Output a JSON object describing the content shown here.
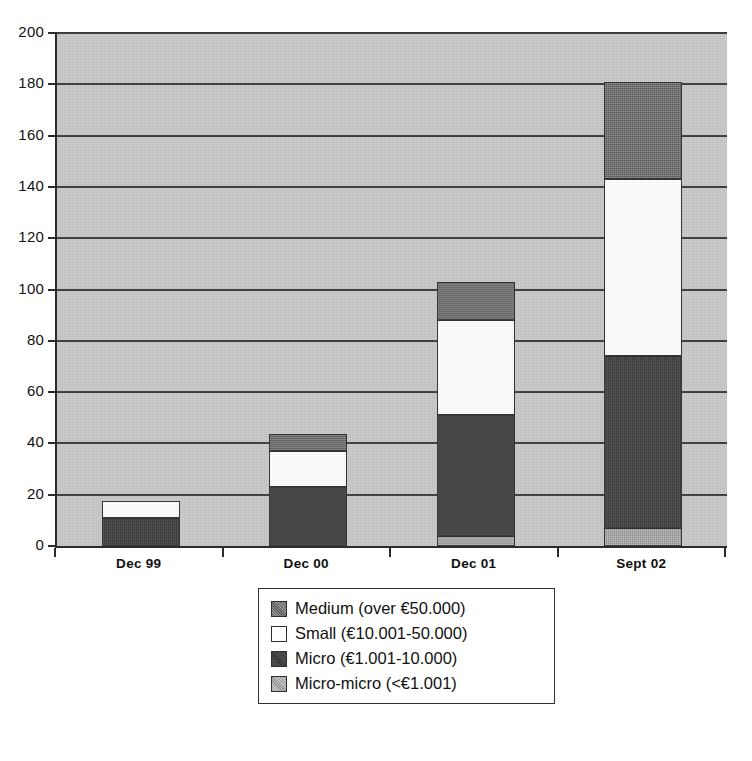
{
  "chart_data": {
    "type": "bar",
    "subtype": "stacked-vertical",
    "title": "",
    "xlabel": "",
    "ylabel": "",
    "categories": [
      "Dec 99",
      "Dec 00",
      "Dec 01",
      "Sept 02"
    ],
    "ylim": [
      0,
      200
    ],
    "yticks": [
      0,
      20,
      40,
      60,
      80,
      100,
      120,
      140,
      160,
      180,
      200
    ],
    "ytick_labels": [
      "0",
      "20",
      "40",
      "60",
      "80",
      "100",
      "120",
      "140",
      "160",
      "180",
      "200"
    ],
    "grid": true,
    "grid_axis": "y",
    "legend_position": "bottom-center",
    "stack_order_bottom_to_top": [
      "Micro-micro (<€1.001)",
      "Micro (€1.001-10.000)",
      "Small (€10.001-50.000)",
      "Medium (over €50.000)"
    ],
    "series": [
      {
        "name": "Medium (over €50.000)",
        "key": "medium",
        "color": "#6e6e6e",
        "values": [
          0,
          6.5,
          15,
          38
        ]
      },
      {
        "name": "Small (€10.001-50.000)",
        "key": "small",
        "color": "#ffffff",
        "values": [
          6.5,
          14,
          37,
          69
        ]
      },
      {
        "name": "Micro (€1.001-10.000)",
        "key": "micro",
        "color": "#3b3b3b",
        "values": [
          11,
          23,
          47,
          67
        ]
      },
      {
        "name": "Micro-micro (<€1.001)",
        "key": "micromicro",
        "color": "#a8a8a8",
        "values": [
          0,
          0,
          4,
          7
        ]
      }
    ],
    "cumulative_tops": {
      "Dec 99": {
        "micromicro": 0,
        "micro": 11,
        "small": 17.5,
        "medium": 17.5
      },
      "Dec 00": {
        "micromicro": 0,
        "micro": 23,
        "small": 37,
        "medium": 43.5
      },
      "Dec 01": {
        "micromicro": 4,
        "micro": 51,
        "small": 88,
        "medium": 103
      },
      "Sept 02": {
        "micromicro": 7,
        "micro": 74,
        "small": 143,
        "medium": 181
      }
    },
    "totals": [
      17.5,
      43.5,
      103,
      181
    ]
  },
  "legend": {
    "items": [
      {
        "label": "Medium (over €50.000)",
        "swatch": "medium"
      },
      {
        "label": "Small (€10.001-50.000)",
        "swatch": "small"
      },
      {
        "label": "Micro (€1.001-10.000)",
        "swatch": "micro"
      },
      {
        "label": "Micro-micro (<€1.001)",
        "swatch": "micromicro"
      }
    ]
  },
  "axis": {
    "y_labels": [
      "200",
      "180",
      "160",
      "140",
      "120",
      "100",
      "80",
      "60",
      "40",
      "20",
      "0"
    ],
    "x_labels": [
      "Dec 99",
      "Dec 00",
      "Dec 01",
      "Sept 02"
    ]
  },
  "colors": {
    "plot_background": "#c9c9c9",
    "axis": "#2b2b2b",
    "gridline": "#3a3a3a",
    "medium": "#6e6e6e",
    "small": "#ffffff",
    "micro": "#3b3b3b",
    "micromicro": "#a8a8a8",
    "page_background": "#ffffff"
  }
}
